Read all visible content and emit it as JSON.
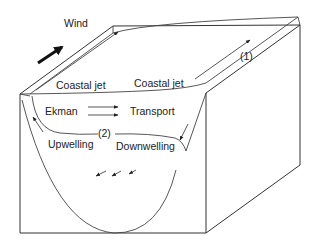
{
  "diagram": {
    "type": "3D block schematic of coastal upwelling/downwelling",
    "labels": {
      "wind": "Wind",
      "coastal_jet_left": "Coastal jet",
      "coastal_jet_right": "Coastal jet",
      "marker_1": "(1)",
      "ekman": "Ekman",
      "transport": "Transport",
      "marker_2": "(2)",
      "upwelling": "Upwelling",
      "downwelling": "Downwelling"
    },
    "colors": {
      "line": "#333333",
      "text": "#222222",
      "background": "#ffffff"
    }
  }
}
